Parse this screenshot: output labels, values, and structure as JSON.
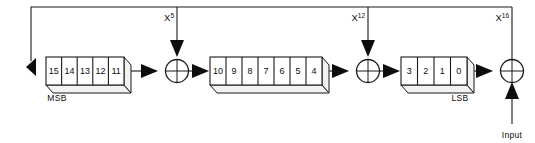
{
  "diagram": {
    "type": "lfsr-block-diagram",
    "colors": {
      "line": "#1a1a1a",
      "fill": "#ffffff",
      "side_face": "#f2f2f2",
      "arrow": "#0d0d0d"
    },
    "registers": [
      {
        "id": "register-block-1",
        "label": "MSB",
        "cells": [
          "15",
          "14",
          "13",
          "12",
          "11"
        ]
      },
      {
        "id": "register-block-2",
        "label": "",
        "cells": [
          "10",
          "9",
          "8",
          "7",
          "6",
          "5",
          "4"
        ]
      },
      {
        "id": "register-block-3",
        "label": "LSB",
        "cells": [
          "3",
          "2",
          "1",
          "0"
        ]
      }
    ],
    "taps": [
      {
        "id": "tap-x5",
        "base": "X",
        "exponent": "5"
      },
      {
        "id": "tap-x12",
        "base": "X",
        "exponent": "12"
      },
      {
        "id": "tap-x16",
        "base": "X",
        "exponent": "16"
      }
    ],
    "xor_gates": [
      {
        "id": "xor-gate-1",
        "symbol": "xor"
      },
      {
        "id": "xor-gate-2",
        "symbol": "xor"
      },
      {
        "id": "xor-gate-3",
        "symbol": "xor"
      }
    ],
    "input_label": "Input",
    "msb_label": "MSB",
    "lsb_label": "LSB"
  }
}
